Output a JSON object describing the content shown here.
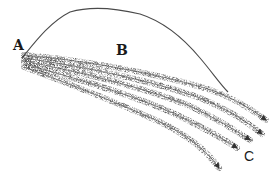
{
  "diagram": {
    "type": "illustration",
    "labels": {
      "a": "A",
      "b": "B",
      "c": "C"
    },
    "colors": {
      "background": "#ffffff",
      "line": "#4a4a4a",
      "stipple": "#333333",
      "label": "#1a1a1a"
    },
    "outline": {
      "path": "M22,58 C35,42 50,22 70,12 C90,6 115,8 140,14 C165,22 185,40 200,58 C212,72 220,84 228,92"
    },
    "flow_bands": [
      {
        "name": "band-1",
        "path": "M24,55 C80,60 150,72 205,88 C230,96 250,108 266,120",
        "arrow_tip": [
          266,
          120
        ]
      },
      {
        "name": "band-2",
        "path": "M24,58 C80,66 150,80 200,98 C225,108 245,120 262,134",
        "arrow_tip": [
          262,
          134
        ]
      },
      {
        "name": "band-3",
        "path": "M24,61 C80,72 145,88 190,106 C215,118 235,130 250,140",
        "arrow_tip": [
          250,
          140
        ]
      },
      {
        "name": "band-4",
        "path": "M24,64 C75,78 135,96 175,114 C200,126 222,138 237,148",
        "arrow_tip": [
          237,
          148
        ]
      },
      {
        "name": "band-5",
        "path": "M24,67 C70,84 120,104 160,122 C185,134 205,148 219,168",
        "arrow_tip": [
          219,
          168
        ]
      }
    ]
  }
}
